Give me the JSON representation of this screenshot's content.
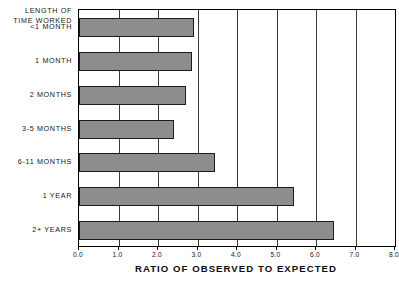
{
  "chart_data": {
    "type": "bar",
    "orientation": "horizontal",
    "title": "",
    "xlabel": "RATIO OF OBSERVED TO EXPECTED",
    "ylabel": "LENGTH OF TIME WORKED",
    "ylabel_line1": "LENGTH OF",
    "ylabel_line2": "TIME WORKED",
    "categories": [
      "<1 MONTH",
      "1 MONTH",
      "2 MONTHS",
      "3-5 MONTHS",
      "6-11 MONTHS",
      "1 YEAR",
      "2+ YEARS"
    ],
    "values": [
      2.9,
      2.85,
      2.7,
      2.4,
      3.45,
      5.45,
      6.45
    ],
    "xlim": [
      0.0,
      8.0
    ],
    "xticks": [
      0.0,
      1.0,
      2.0,
      3.0,
      4.0,
      5.0,
      6.0,
      7.0,
      8.0
    ],
    "xtick_labels": [
      "0.0",
      "1.0",
      "2.0",
      "3.0",
      "4.0",
      "5.0",
      "6.0",
      "7.0",
      "8.0"
    ],
    "grid": "vertical",
    "legend": null,
    "bar_color": "#8d8d8d",
    "bar_edge_color": "#1c1c1c",
    "grid_color": "#3a3a3a",
    "frame_color": "#000000"
  }
}
